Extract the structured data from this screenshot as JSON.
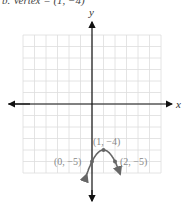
{
  "header": {
    "text": "b. Vertex = (1, −4)"
  },
  "chart_data": {
    "type": "line",
    "title": "",
    "xlabel": "x",
    "ylabel": "y",
    "grid": true,
    "xlim": [
      -6,
      6
    ],
    "ylim": [
      -6,
      6
    ],
    "series": [
      {
        "name": "parabola",
        "equation": "y = -(x-1)^2 - 4",
        "x": [
          -0.5,
          0,
          1,
          2,
          2.5
        ],
        "y": [
          -6.25,
          -5,
          -4,
          -5,
          -6.25
        ]
      }
    ],
    "points": [
      {
        "label": "(1, −4)",
        "x": 1,
        "y": -4
      },
      {
        "label": "(0, −5)",
        "x": 0,
        "y": -5
      },
      {
        "label": "(2, −5)",
        "x": 2,
        "y": -5
      }
    ],
    "annotations": [
      "(1, −4)",
      "(0, −5)",
      "(2, −5)"
    ]
  },
  "labels": {
    "x_axis": "x",
    "y_axis": "y",
    "vertex": "(1, −4)",
    "left_point": "(0, −5)",
    "right_point": "(2, −5)"
  }
}
